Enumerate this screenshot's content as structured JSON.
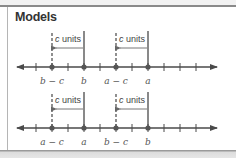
{
  "title": "Models",
  "colors": {
    "line": "#4a4a4a",
    "dot": "#555555",
    "text": "#444444",
    "label": "#555555",
    "border": "#8a8a8a"
  },
  "models": [
    {
      "offset_label": "c units",
      "offset_variable": "c",
      "offset_unit": "units",
      "points": [
        {
          "label": "b − c",
          "kind": "shifted"
        },
        {
          "label": "b",
          "kind": "original"
        },
        {
          "label": "a − c",
          "kind": "shifted"
        },
        {
          "label": "a",
          "kind": "original"
        }
      ]
    },
    {
      "offset_label": "c units",
      "offset_variable": "c",
      "offset_unit": "units",
      "points": [
        {
          "label": "a − c",
          "kind": "shifted"
        },
        {
          "label": "a",
          "kind": "original"
        },
        {
          "label": "b − c",
          "kind": "shifted"
        },
        {
          "label": "b",
          "kind": "original"
        }
      ]
    }
  ]
}
